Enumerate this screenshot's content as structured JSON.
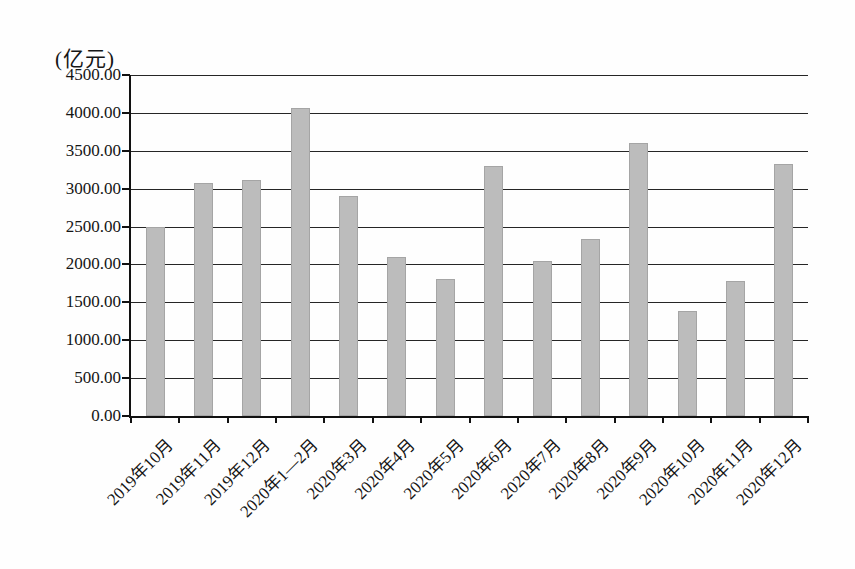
{
  "chart_data": {
    "type": "bar",
    "unit_label": "(亿元)",
    "title": "",
    "xlabel": "",
    "ylabel": "亿元",
    "categories": [
      "2019年10月",
      "2019年11月",
      "2019年12月",
      "2020年1—2月",
      "2020年3月",
      "2020年4月",
      "2020年5月",
      "2020年6月",
      "2020年7月",
      "2020年8月",
      "2020年9月",
      "2020年10月",
      "2020年11月",
      "2020年12月"
    ],
    "values": [
      2500,
      3070,
      3120,
      4060,
      2900,
      2100,
      1810,
      3300,
      2040,
      2330,
      3600,
      1380,
      1780,
      3330
    ],
    "y_ticks": [
      "4500.00",
      "4000.00",
      "3500.00",
      "3000.00",
      "2500.00",
      "2000.00",
      "1500.00",
      "1000.00",
      "500.00",
      "0.00"
    ],
    "ylim": [
      0,
      4500
    ],
    "ytick_step": 500,
    "grid": "horizontal",
    "legend": "none",
    "bar_color": "#bcbcbc",
    "grid_color": "#262626",
    "text_color": "#151515"
  }
}
